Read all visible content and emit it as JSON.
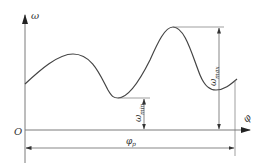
{
  "diagram": {
    "type": "angular-velocity-curve",
    "colors": {
      "line": "#444444",
      "axis": "#7a7a7a",
      "text": "#333333"
    },
    "labels": {
      "y_axis": "ω",
      "x_axis": "φ",
      "origin": "O",
      "omega_min_base": "ω",
      "omega_min_sub": "min",
      "omega_max_base": "ω",
      "omega_max_sub": "max",
      "period_base": "φ",
      "period_sub": "p"
    }
  }
}
